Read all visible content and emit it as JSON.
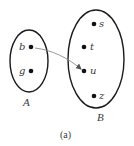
{
  "diagram": {
    "caption": "(a)",
    "sets": [
      {
        "id": "A",
        "label": "A",
        "elements": [
          "b",
          "g"
        ]
      },
      {
        "id": "B",
        "label": "B",
        "elements": [
          "s",
          "t",
          "u",
          "z"
        ]
      }
    ],
    "mappings": [
      {
        "from": "b",
        "to": "u"
      }
    ],
    "colors": {
      "outline": "#1a1a1a",
      "dot": "#111111",
      "arrow": "#8a8a8a",
      "text": "#3a3a3a"
    }
  }
}
